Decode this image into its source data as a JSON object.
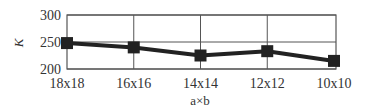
{
  "chart_data": {
    "type": "line",
    "title": "",
    "xlabel": "a×b",
    "ylabel": "K",
    "categories": [
      "18x18",
      "16x16",
      "14x14",
      "12x12",
      "10x10"
    ],
    "series": [
      {
        "name": "K",
        "values": [
          248,
          240,
          225,
          233,
          215
        ],
        "color": "#222222",
        "marker": "square"
      }
    ],
    "ylim": [
      200,
      300
    ],
    "yticks": [
      200,
      250,
      300
    ],
    "grid": true,
    "legend": null
  },
  "labels": {
    "y_ticks": [
      "300",
      "250",
      "200"
    ],
    "x_ticks": [
      "18x18",
      "16x16",
      "14x14",
      "12x12",
      "10x10"
    ],
    "x_axis_title": "a×b",
    "y_axis_title": "K"
  }
}
